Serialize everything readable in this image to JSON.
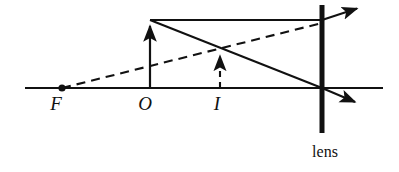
{
  "figure": {
    "kind": "optics-ray-diagram",
    "background_color": "#ffffff",
    "stroke_color": "#111111",
    "width": 399,
    "height": 172
  },
  "labels": {
    "focal_point": "F",
    "object_point": "O",
    "image_point": "I",
    "lens": "lens"
  },
  "geometry": {
    "optical_axis": {
      "x1": 25,
      "y1": 88,
      "x2": 383,
      "y2": 88
    },
    "focal_dot": {
      "cx": 62,
      "cy": 88,
      "r": 3.4
    },
    "object_arrow": {
      "x": 150,
      "y_base": 88,
      "y_tip": 20,
      "style": "solid"
    },
    "image_arrow": {
      "x": 220,
      "y_base": 88,
      "y_tip": 50,
      "style": "dashed"
    },
    "lens_line": {
      "x": 322,
      "y_top": 5,
      "y_bottom": 133,
      "thickness": 5
    },
    "parallel_ray": {
      "x1": 150,
      "y1": 20,
      "x2": 322,
      "y2": 20,
      "style": "solid"
    },
    "refracted_upper_ray": {
      "x1": 322,
      "y1": 20,
      "x2": 362,
      "y2": 7,
      "style": "solid",
      "arrow": true
    },
    "chief_ray": {
      "x1": 150,
      "y1": 20,
      "x2": 322,
      "y2": 88,
      "style": "solid"
    },
    "refracted_lower_ray": {
      "x1": 322,
      "y1": 88,
      "x2": 362,
      "y2": 105,
      "style": "solid",
      "arrow": true
    },
    "virtual_ray_from_focus": {
      "x1": 62,
      "y1": 88,
      "x2": 322,
      "y2": 23,
      "style": "dashed"
    }
  },
  "label_positions": {
    "focal_point": {
      "x": 56,
      "y": 110
    },
    "object_point": {
      "x": 143,
      "y": 110
    },
    "image_point": {
      "x": 215,
      "y": 110
    },
    "lens": {
      "x": 303,
      "y": 157
    }
  }
}
